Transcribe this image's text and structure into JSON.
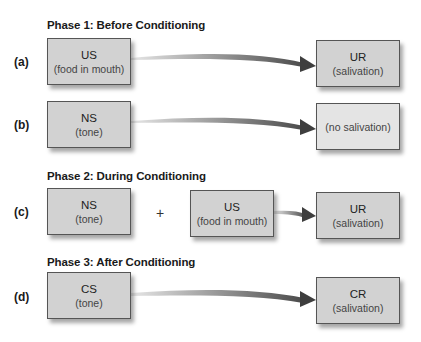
{
  "phases": [
    {
      "title": "Phase 1: Before Conditioning",
      "rows": [
        {
          "label": "(a)",
          "stimulus": {
            "abbr": "US",
            "desc": "(food in mouth)"
          },
          "response": {
            "abbr": "UR",
            "desc": "(salivation)"
          }
        },
        {
          "label": "(b)",
          "stimulus": {
            "abbr": "NS",
            "desc": "(tone)"
          },
          "response": {
            "abbr": "",
            "desc": "(no salivation)"
          }
        }
      ]
    },
    {
      "title": "Phase 2: During Conditioning",
      "rows": [
        {
          "label": "(c)",
          "stimulus": {
            "abbr": "NS",
            "desc": "(tone)"
          },
          "operator": "+",
          "stimulus2": {
            "abbr": "US",
            "desc": "(food in mouth)"
          },
          "response": {
            "abbr": "UR",
            "desc": "(salivation)"
          }
        }
      ]
    },
    {
      "title": "Phase 3: After Conditioning",
      "rows": [
        {
          "label": "(d)",
          "stimulus": {
            "abbr": "CS",
            "desc": "(tone)"
          },
          "response": {
            "abbr": "CR",
            "desc": "(salivation)"
          }
        }
      ]
    }
  ],
  "colors": {
    "box_fill": "#d2d2d2",
    "box_fill_light": "#e4e4e4",
    "box_border": "#555555",
    "arrow_dark": "#4a4a4a",
    "arrow_light": "#dcdcdc"
  }
}
